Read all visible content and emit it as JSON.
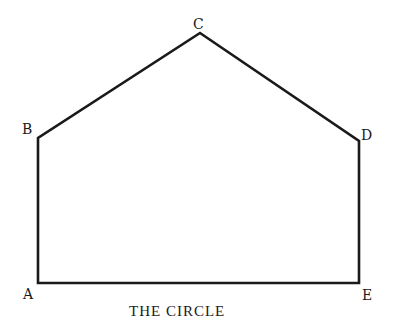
{
  "diagram": {
    "caption": "THE CIRCLE",
    "stroke_color": "#1a1a1a",
    "vertices": [
      {
        "label": "A",
        "x": 38,
        "y": 283
      },
      {
        "label": "B",
        "x": 38,
        "y": 138
      },
      {
        "label": "C",
        "x": 200,
        "y": 33
      },
      {
        "label": "D",
        "x": 359,
        "y": 141
      },
      {
        "label": "E",
        "x": 359,
        "y": 283
      }
    ],
    "edges": [
      [
        "A",
        "B"
      ],
      [
        "B",
        "C"
      ],
      [
        "C",
        "D"
      ],
      [
        "D",
        "E"
      ],
      [
        "E",
        "A"
      ]
    ]
  }
}
